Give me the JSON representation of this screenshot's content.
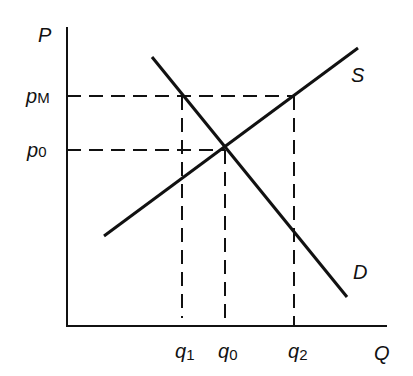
{
  "diagram": {
    "type": "supply-demand",
    "axes": {
      "y_label": "P",
      "x_label": "Q"
    },
    "price_labels": {
      "pM": {
        "base": "p",
        "sub": "M"
      },
      "p0": {
        "base": "p",
        "sub": "0"
      }
    },
    "quantity_labels": {
      "q1": {
        "base": "q",
        "sub": "1"
      },
      "q0": {
        "base": "q",
        "sub": "0"
      },
      "q2": {
        "base": "q",
        "sub": "2"
      }
    },
    "curves": {
      "supply": {
        "label": "S"
      },
      "demand": {
        "label": "D"
      }
    },
    "colors": {
      "line": "#111111",
      "background": "#ffffff"
    }
  }
}
